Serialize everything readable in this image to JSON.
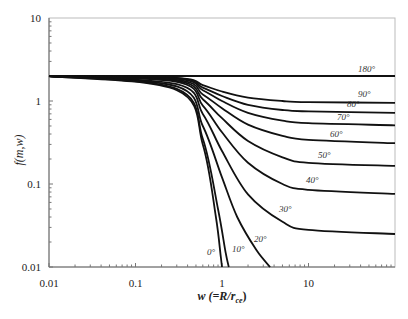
{
  "chart_data": {
    "type": "line",
    "title": "",
    "xlabel": "w (=R/r_ce)",
    "ylabel": "f(m,w)",
    "xscale": "log",
    "yscale": "log",
    "xlim": [
      0.01,
      100
    ],
    "ylim": [
      0.01,
      10
    ],
    "x_ticks": [
      "0.01",
      "0.1",
      "1",
      "10"
    ],
    "y_ticks": [
      "0.01",
      "0.1",
      "1",
      "10"
    ],
    "grid": false,
    "legend": "inline curve labels",
    "series": [
      {
        "name": "180°",
        "label": "180°",
        "x": [
          0.01,
          0.1,
          1,
          10,
          100
        ],
        "y": [
          2.0,
          2.0,
          2.0,
          2.0,
          2.0
        ]
      },
      {
        "name": "90°",
        "label": "90°",
        "x": [
          0.01,
          0.3,
          0.6,
          1,
          2,
          5,
          10,
          100
        ],
        "y": [
          2.0,
          1.9,
          1.55,
          1.3,
          1.1,
          1.0,
          0.97,
          0.95
        ]
      },
      {
        "name": "80°",
        "label": "80°",
        "x": [
          0.01,
          0.3,
          0.6,
          1,
          2,
          5,
          10,
          100
        ],
        "y": [
          2.0,
          1.88,
          1.45,
          1.15,
          0.9,
          0.78,
          0.75,
          0.72
        ]
      },
      {
        "name": "70°",
        "label": "70°",
        "x": [
          0.01,
          0.3,
          0.6,
          1,
          2,
          5,
          10,
          100
        ],
        "y": [
          2.0,
          1.85,
          1.35,
          1.0,
          0.72,
          0.58,
          0.54,
          0.51
        ]
      },
      {
        "name": "60°",
        "label": "60°",
        "x": [
          0.01,
          0.3,
          0.6,
          1,
          2,
          5,
          10,
          100
        ],
        "y": [
          2.0,
          1.8,
          1.2,
          0.82,
          0.52,
          0.38,
          0.34,
          0.31
        ]
      },
      {
        "name": "50°",
        "label": "50°",
        "x": [
          0.01,
          0.3,
          0.6,
          1,
          2,
          5,
          10,
          100
        ],
        "y": [
          2.0,
          1.75,
          1.05,
          0.62,
          0.33,
          0.21,
          0.18,
          0.165
        ]
      },
      {
        "name": "40°",
        "label": "40°",
        "x": [
          0.01,
          0.3,
          0.6,
          1,
          2,
          5,
          10,
          100
        ],
        "y": [
          2.0,
          1.7,
          0.88,
          0.42,
          0.18,
          0.1,
          0.085,
          0.076
        ]
      },
      {
        "name": "30°",
        "label": "30°",
        "x": [
          0.01,
          0.3,
          0.6,
          1,
          2,
          5,
          10,
          100
        ],
        "y": [
          2.0,
          1.6,
          0.7,
          0.25,
          0.075,
          0.035,
          0.028,
          0.025
        ]
      },
      {
        "name": "20°",
        "label": "20°",
        "x": [
          0.01,
          0.3,
          0.6,
          1,
          1.5,
          2.5,
          3.6
        ],
        "y": [
          2.0,
          1.5,
          0.5,
          0.12,
          0.04,
          0.016,
          0.01
        ]
      },
      {
        "name": "10°",
        "label": "10°",
        "x": [
          0.01,
          0.3,
          0.6,
          0.9,
          1.1,
          1.2
        ],
        "y": [
          2.0,
          1.4,
          0.35,
          0.05,
          0.015,
          0.01
        ]
      },
      {
        "name": "0°",
        "label": "0°",
        "x": [
          0.01,
          0.3,
          0.6,
          0.85,
          0.97,
          1.0
        ],
        "y": [
          2.0,
          1.35,
          0.3,
          0.04,
          0.013,
          0.01
        ]
      }
    ]
  },
  "labels": {
    "y_axis_title": "f(m,w)",
    "x_axis_title_prefix": "w (=",
    "x_axis_title_R": "R",
    "x_axis_title_slash": "/",
    "x_axis_title_r": "r",
    "x_axis_title_sub": "ce",
    "x_axis_title_suffix": ")"
  }
}
